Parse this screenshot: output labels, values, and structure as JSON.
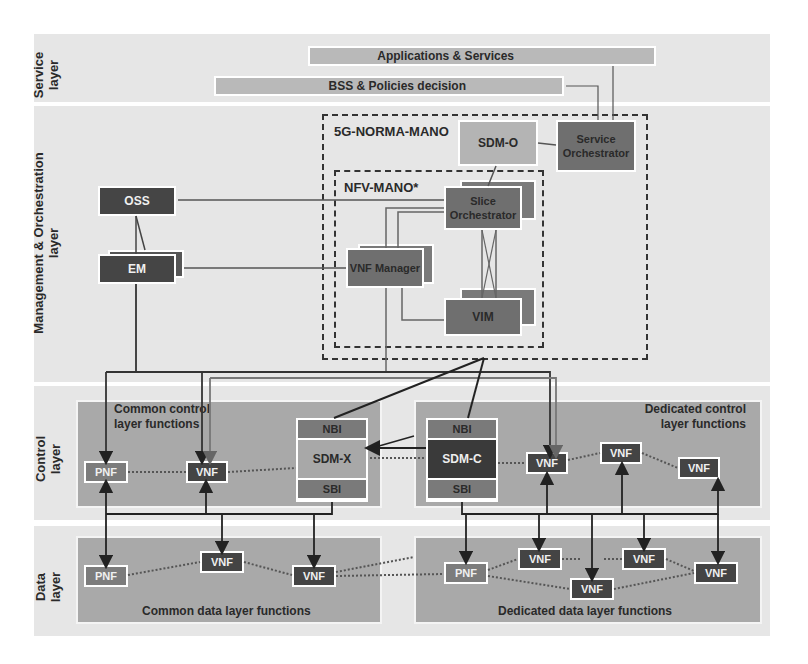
{
  "layers": {
    "service": "Service layer",
    "mano": "Management & Orchestration layer",
    "control": "Control layer",
    "data": "Data layer"
  },
  "service_layer": {
    "applications": "Applications & Services",
    "bss": "BSS & Policies decision"
  },
  "mano_layer": {
    "oss": "OSS",
    "em": "EM",
    "norma_mano_title": "5G-NORMA-MANO",
    "nfv_mano_title": "NFV-MANO*",
    "sdm_o": "SDM-O",
    "service_orchestrator": "Service Orchestrator",
    "slice_orchestrator": "Slice Orchestrator",
    "vnf_manager": "VNF Manager",
    "vim": "VIM"
  },
  "control_layer": {
    "common_label": "Common control layer functions",
    "dedicated_label": "Dedicated control layer functions",
    "sdm_x": {
      "nbi": "NBI",
      "name": "SDM-X",
      "sbi": "SBI"
    },
    "sdm_c": {
      "nbi": "NBI",
      "name": "SDM-C",
      "sbi": "SBI"
    },
    "common_nodes": [
      "PNF",
      "VNF"
    ],
    "dedicated_nodes": [
      "VNF",
      "VNF",
      "VNF"
    ]
  },
  "data_layer": {
    "common_label": "Common data layer functions",
    "dedicated_label": "Dedicated data layer functions",
    "common_nodes": [
      "PNF",
      "VNF",
      "VNF"
    ],
    "dedicated_nodes": [
      "PNF",
      "VNF",
      "VNF",
      "VNF",
      "VNF"
    ]
  },
  "colors": {
    "band": "#e6e6e6",
    "dark_box": "#454545",
    "mid_box": "#6f6f6f",
    "light_box": "#b4b4b4",
    "region": "#a9a9a9"
  }
}
